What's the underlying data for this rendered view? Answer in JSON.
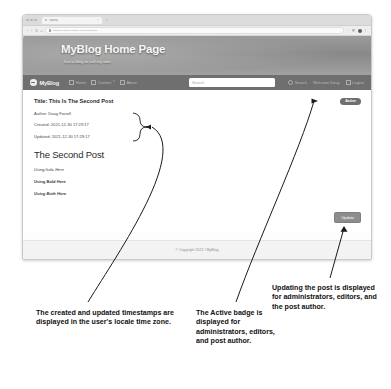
{
  "browser": {
    "tab_title": "MyBlog",
    "tab_close": "×",
    "new_tab": "+",
    "url": "https://myblog.example.com/blog/post/2",
    "back_icon": "‹",
    "forward_icon": "›",
    "reload_icon": "↻",
    "home_icon": "⌂",
    "star_icon": "☆",
    "ext_icon": "▦",
    "menu_icon": "⋮"
  },
  "hero": {
    "title": "MyBlog Home Page",
    "subtitle": "Just a blog to call my own"
  },
  "nav": {
    "brand": "MyBlog",
    "links": [
      {
        "label": "Home",
        "icon": "home-icon",
        "caret": ""
      },
      {
        "label": "Content",
        "icon": "content-icon",
        "caret": "▾"
      },
      {
        "label": "About",
        "icon": "about-icon",
        "caret": ""
      }
    ],
    "search_placeholder": "Search",
    "search_button": "Search",
    "search_icon": "search-icon",
    "welcome": "Welcome Doug",
    "logout": "Logout",
    "logout_icon": "logout-icon"
  },
  "post": {
    "title": "Title: This Is The Second Post",
    "author": "Author: Doug Farrell",
    "created": "Created: 2021-12-30 17:29:17",
    "updated": "Updated: 2021-12-30 17:29:17",
    "heading": "The Second Post",
    "lines": [
      "Using Italic Here",
      "Using Bold Here",
      "Using Both Here"
    ],
    "badge": "Active",
    "update_button": "Update"
  },
  "footer": {
    "copyright": "© Copyright 2021 / MyBlog"
  },
  "annotations": [
    "The created and updated timestamps are displayed in the user's locale time zone.",
    "The Active badge is displayed for administrators, editors, and post author.",
    "Updating the post is displayed for administrators, editors, and the post author."
  ],
  "colors": {
    "nav_bg": "#6f6f6f",
    "badge_bg": "#6f6f6f",
    "button_bg": "#8d8d8d",
    "page_bg": "#ffffff"
  }
}
